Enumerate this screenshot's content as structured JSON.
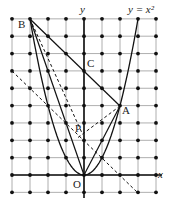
{
  "diagram": {
    "type": "coordinate-geometry",
    "curve": "y = x^2",
    "grid": {
      "x_range": [
        -4,
        4
      ],
      "y_range": [
        -1,
        9
      ],
      "dots_at_intersections": true
    },
    "axes": {
      "x_label": "x",
      "y_label": "y"
    },
    "labels": {
      "curve": "y = x²",
      "y_axis": "y",
      "x_axis": "x",
      "origin": "O",
      "A": "A",
      "B": "B",
      "C": "C",
      "P": "P"
    },
    "points": {
      "O": [
        0,
        0
      ],
      "A": [
        2,
        4
      ],
      "B": [
        -3,
        9
      ],
      "C": [
        0,
        6
      ],
      "P": [
        -0.1,
        2.4
      ]
    },
    "solid_segments": [
      [
        "B",
        "A"
      ],
      [
        "B",
        "O"
      ],
      [
        "A",
        "O"
      ]
    ],
    "dashed_segments": [
      [
        "B",
        "P"
      ],
      [
        "A",
        "P"
      ],
      [
        "line y = -x + 2",
        "from (-4,6) to (3,-1)"
      ]
    ]
  }
}
